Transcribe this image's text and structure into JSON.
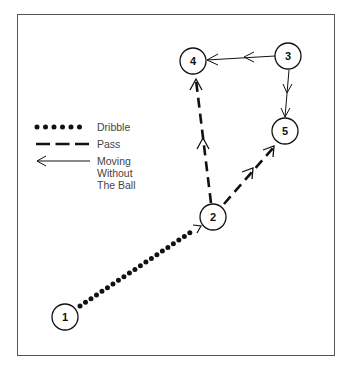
{
  "diagram": {
    "type": "basketball-play",
    "players": [
      {
        "id": "1",
        "label": "1",
        "cx": 65,
        "cy": 317
      },
      {
        "id": "2",
        "label": "2",
        "cx": 213,
        "cy": 217
      },
      {
        "id": "3",
        "label": "3",
        "cx": 288,
        "cy": 56
      },
      {
        "id": "4",
        "label": "4",
        "cx": 193,
        "cy": 61
      },
      {
        "id": "5",
        "label": "5",
        "cx": 285,
        "cy": 131
      }
    ],
    "actions": [
      {
        "from": "1",
        "to": "2",
        "kind": "dribble"
      },
      {
        "from": "2",
        "to": "4",
        "kind": "pass"
      },
      {
        "from": "2",
        "to": "5",
        "kind": "pass"
      },
      {
        "from": "3",
        "to": "4",
        "kind": "moving-without-ball"
      },
      {
        "from": "3",
        "to": "5",
        "kind": "moving-without-ball"
      }
    ]
  },
  "legend": {
    "dribble": "Dribble",
    "pass": "Pass",
    "moving_line1": "Moving",
    "moving_line2": "Without",
    "moving_line3": "The Ball"
  },
  "colors": {
    "ink": "#111111",
    "frame": "#555555",
    "legend_text": "#444444",
    "background": "#ffffff"
  }
}
